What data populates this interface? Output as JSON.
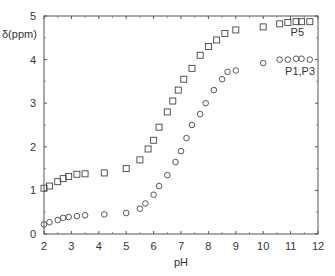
{
  "chart_data": {
    "type": "scatter",
    "title": "",
    "xlabel": "pH",
    "ylabel": "δ(ppm)",
    "xlim": [
      2,
      12
    ],
    "ylim": [
      0,
      5
    ],
    "xticks": [
      2,
      3,
      4,
      5,
      6,
      7,
      8,
      9,
      10,
      11,
      12
    ],
    "yticks": [
      0,
      1,
      2,
      3,
      4,
      5
    ],
    "grid": false,
    "legend": "inline labels at right end of series",
    "series": [
      {
        "name": "P5",
        "marker": "square",
        "x": [
          2.0,
          2.2,
          2.5,
          2.7,
          2.9,
          3.2,
          3.5,
          4.2,
          5.0,
          5.5,
          5.8,
          6.0,
          6.2,
          6.5,
          6.7,
          6.9,
          7.1,
          7.4,
          7.7,
          8.0,
          8.3,
          8.6,
          9.0,
          10.0,
          10.6,
          10.9,
          11.2,
          11.4,
          11.7
        ],
        "y": [
          1.05,
          1.1,
          1.2,
          1.27,
          1.32,
          1.37,
          1.38,
          1.4,
          1.5,
          1.7,
          1.95,
          2.15,
          2.45,
          2.8,
          3.05,
          3.3,
          3.55,
          3.8,
          4.1,
          4.3,
          4.45,
          4.6,
          4.68,
          4.75,
          4.82,
          4.85,
          4.87,
          4.87,
          4.87
        ]
      },
      {
        "name": "P1,P3",
        "marker": "circle",
        "x": [
          2.0,
          2.2,
          2.5,
          2.7,
          2.9,
          3.2,
          3.5,
          4.2,
          5.0,
          5.5,
          5.7,
          6.0,
          6.2,
          6.5,
          6.8,
          7.0,
          7.2,
          7.4,
          7.7,
          7.9,
          8.2,
          8.5,
          8.7,
          9.0,
          10.0,
          10.6,
          10.9,
          11.2,
          11.4,
          11.7
        ],
        "y": [
          0.22,
          0.27,
          0.32,
          0.37,
          0.39,
          0.41,
          0.43,
          0.45,
          0.48,
          0.58,
          0.7,
          0.9,
          1.1,
          1.35,
          1.65,
          1.9,
          2.2,
          2.5,
          2.75,
          3.0,
          3.3,
          3.55,
          3.72,
          3.75,
          3.92,
          4.0,
          4.0,
          4.02,
          4.02,
          4.0
        ]
      }
    ],
    "annotations": [
      {
        "text": "P5",
        "x": 11.0,
        "y": 4.55
      },
      {
        "text": "P1,P3",
        "x": 10.8,
        "y": 3.65
      }
    ]
  }
}
